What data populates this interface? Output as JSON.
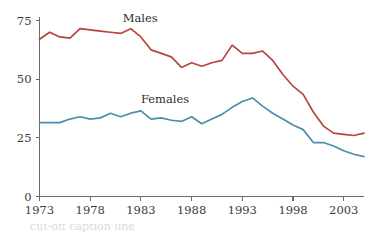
{
  "chart_data": {
    "type": "line",
    "title": "",
    "subtitle": "",
    "xlabel": "",
    "ylabel": "",
    "xlim": [
      1973,
      2005
    ],
    "ylim": [
      0,
      75
    ],
    "grid": false,
    "legend_position": "inline-labels",
    "x_ticks": [
      "1973",
      "1978",
      "1983",
      "1988",
      "1993",
      "1998",
      "2003"
    ],
    "x_tick_values": [
      1973,
      1978,
      1983,
      1988,
      1993,
      1998,
      2003
    ],
    "y_ticks": [
      "0",
      "25",
      "50",
      "75"
    ],
    "y_tick_values": [
      0,
      25,
      50,
      75
    ],
    "x": [
      1973,
      1974,
      1975,
      1976,
      1977,
      1978,
      1979,
      1980,
      1981,
      1982,
      1983,
      1984,
      1985,
      1986,
      1987,
      1988,
      1989,
      1990,
      1991,
      1992,
      1993,
      1994,
      1995,
      1996,
      1997,
      1998,
      1999,
      2000,
      2001,
      2002,
      2003,
      2004,
      2005
    ],
    "series": [
      {
        "name": "Males",
        "color": "#b5453f",
        "label": "Males",
        "values": [
          67,
          70,
          68,
          67.5,
          71.5,
          71,
          70.5,
          70,
          69.5,
          71.5,
          68,
          62.5,
          61,
          59.5,
          55,
          57,
          55.5,
          57,
          58,
          64.5,
          61,
          61,
          62,
          58,
          52,
          47,
          43.5,
          36,
          30,
          27,
          26.5,
          26,
          27
        ]
      },
      {
        "name": "Females",
        "color": "#4a90ab",
        "label": "Females",
        "values": [
          31.5,
          31.5,
          31.5,
          33,
          34,
          33,
          33.5,
          35.5,
          34,
          35.5,
          36.5,
          33,
          33.5,
          32.5,
          32,
          34,
          31,
          33,
          35,
          38,
          40.5,
          42,
          38.5,
          35.5,
          33,
          30.5,
          28.5,
          23,
          23,
          21.5,
          19.5,
          18,
          17
        ]
      }
    ]
  },
  "caption": {
    "text": "cut-off caption line"
  }
}
